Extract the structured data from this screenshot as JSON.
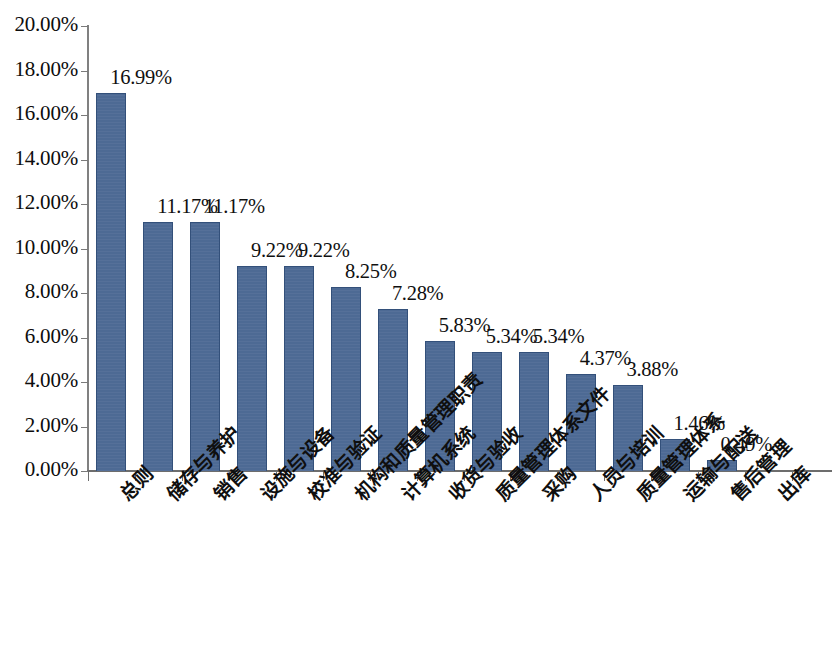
{
  "chart_data": {
    "type": "bar",
    "title": "",
    "subtitle": "",
    "xlabel": "",
    "ylabel": "",
    "ylim": [
      0,
      20
    ],
    "grid": false,
    "legend": "none",
    "value_suffix": "%",
    "categories": [
      "总则",
      "储存与养护",
      "销售",
      "设施与设备",
      "校准与验证",
      "机构和质量管理职责",
      "计算机系统",
      "收货与验收",
      "质量管理体系文件",
      "采购",
      "人员与培训",
      "质量管理体系",
      "运输与配送",
      "售后管理",
      "出库"
    ],
    "values": [
      16.99,
      11.17,
      11.17,
      9.22,
      9.22,
      8.25,
      7.28,
      5.83,
      5.34,
      5.34,
      4.37,
      3.88,
      1.46,
      0.49,
      null
    ],
    "value_labels": [
      "16.99%",
      "11.17%",
      "11.17%",
      "9.22%",
      "9.22%",
      "8.25%",
      "7.28%",
      "5.83%",
      "5.34%",
      "5.34%",
      "4.37%",
      "3.88%",
      "1.46%",
      "0.49%",
      ""
    ],
    "ytick_labels": [
      "0.00%",
      "2.00%",
      "4.00%",
      "6.00%",
      "8.00%",
      "10.00%",
      "12.00%",
      "14.00%",
      "16.00%",
      "18.00%",
      "20.00%"
    ],
    "ytick_values": [
      0,
      2,
      4,
      6,
      8,
      10,
      12,
      14,
      16,
      18,
      20
    ],
    "colors": {
      "bar_fill": "#4d6a94",
      "bar_border": "#33507a",
      "axis": "#6d6d6d",
      "text": "#0f0f0f",
      "background": "#ffffff"
    }
  }
}
